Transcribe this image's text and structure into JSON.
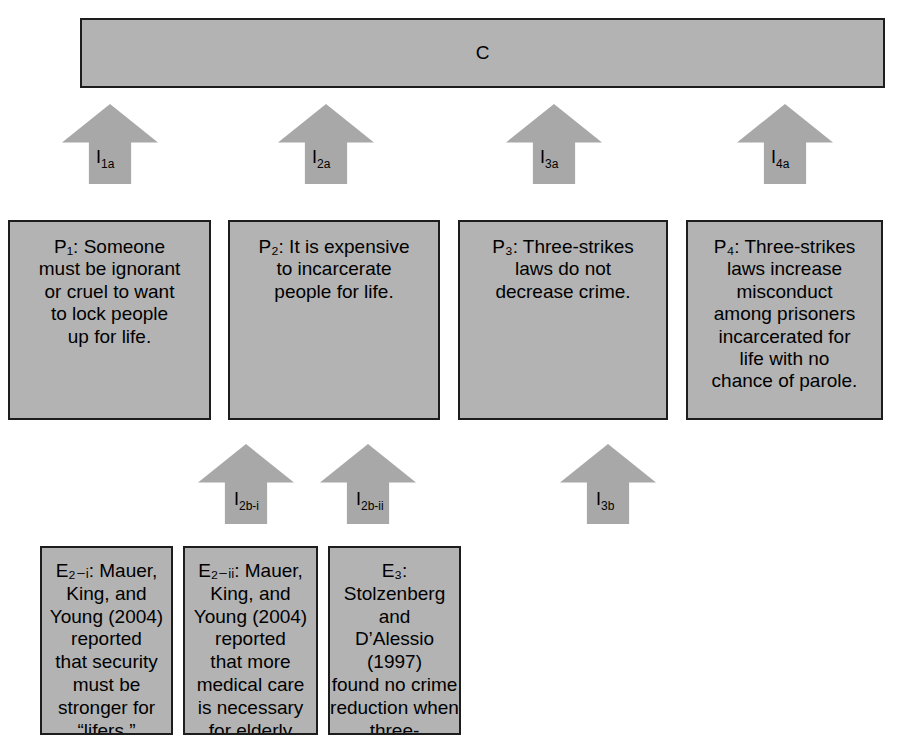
{
  "diagram": {
    "type": "argument-structure-map",
    "claim": {
      "id": "C",
      "label": "C"
    },
    "premises": [
      {
        "id": "P1",
        "prefix": "P",
        "subscript": "1",
        "text": "P₁: Someone\nmust be ignorant\nor cruel to want\nto lock people\nup for life."
      },
      {
        "id": "P2",
        "prefix": "P",
        "subscript": "2",
        "text": "P₂: It is expensive\nto incarcerate\npeople for life."
      },
      {
        "id": "P3",
        "prefix": "P",
        "subscript": "3",
        "text": "P₃: Three-strikes\nlaws do not\ndecrease crime."
      },
      {
        "id": "P4",
        "prefix": "P",
        "subscript": "4",
        "text": "P₄: Three-strikes\nlaws increase\nmisconduct\namong prisoners\nincarcerated for\nlife with no\nchance of parole."
      }
    ],
    "evidence": [
      {
        "id": "E2-i",
        "text": "E₂₋ᵢ: Mauer, King, and\nYoung (2004) reported\nthat security must be\nstronger for “lifers.”"
      },
      {
        "id": "E2-ii",
        "text": "E₂₋ᵢᵢ: Mauer, King, and\nYoung (2004) reported\nthat more medical care\nis necessary for elderly\nprisoners."
      },
      {
        "id": "E3",
        "text": "E₃: Stolzenberg and\nD’Alessio (1997)\nfound no crime\nreduction when three-\nstrikes laws were\nimplemented."
      }
    ],
    "inference_arrows_upper": [
      {
        "id": "I1a",
        "base": "I",
        "subscript": "1a"
      },
      {
        "id": "I2a",
        "base": "I",
        "subscript": "2a"
      },
      {
        "id": "I3a",
        "base": "I",
        "subscript": "3a"
      },
      {
        "id": "I4a",
        "base": "I",
        "subscript": "4a"
      }
    ],
    "inference_arrows_lower": [
      {
        "id": "I2b-i",
        "base": "I",
        "subscript": "2b-i"
      },
      {
        "id": "I2b-ii",
        "base": "I",
        "subscript": "2b-ii"
      },
      {
        "id": "I3b",
        "base": "I",
        "subscript": "3b"
      }
    ],
    "colors": {
      "box_fill": "#b3b3b3",
      "box_border": "#1d1d1d",
      "arrow_fill": "#a8a8a8",
      "text": "#000000",
      "background": "#ffffff"
    }
  }
}
